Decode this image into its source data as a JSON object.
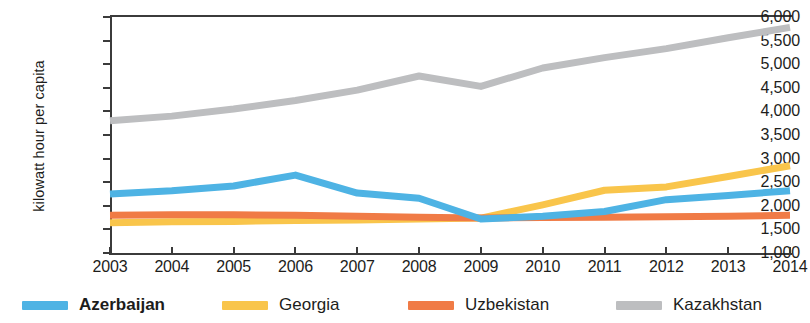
{
  "chart_data": {
    "type": "line",
    "title": "",
    "xlabel": "",
    "ylabel": "kilowatt hour per capita",
    "x": [
      2003,
      2004,
      2005,
      2006,
      2007,
      2008,
      2009,
      2010,
      2011,
      2012,
      2013,
      2014
    ],
    "xtick_labels": [
      "2003",
      "2004",
      "2005",
      "2006",
      "2007",
      "2008",
      "2009",
      "2010",
      "2011",
      "2012",
      "2013",
      "2014"
    ],
    "ytick_labels": [
      "6,000",
      "5,500",
      "5,000",
      "4,500",
      "4,000",
      "3,500",
      "3,000",
      "2,500",
      "2,000",
      "1,500",
      "1,000"
    ],
    "ytick_values": [
      6000,
      5500,
      5000,
      4500,
      4000,
      3500,
      3000,
      2500,
      2000,
      1500,
      1000
    ],
    "ylim": [
      1000,
      6000
    ],
    "ytick_step": 500,
    "grid": false,
    "legend_position": "bottom",
    "series": [
      {
        "name": "Azerbaijan",
        "color": "#4EB3E4",
        "bold_label": true,
        "values": [
          2250,
          2320,
          2420,
          2650,
          2270,
          2160,
          1720,
          1780,
          1880,
          2130,
          2220,
          2320
        ]
      },
      {
        "name": "Georgia",
        "color": "#F9C54B",
        "bold_label": false,
        "values": [
          1640,
          1660,
          1670,
          1690,
          1700,
          1720,
          1740,
          2020,
          2330,
          2400,
          2620,
          2850
        ]
      },
      {
        "name": "Uzbekistan",
        "color": "#F07B46",
        "bold_label": false,
        "values": [
          1800,
          1810,
          1810,
          1800,
          1780,
          1760,
          1740,
          1750,
          1760,
          1770,
          1780,
          1800
        ]
      },
      {
        "name": "Kazakhstan",
        "color": "#BDBEC0",
        "bold_label": false,
        "values": [
          3800,
          3900,
          4050,
          4230,
          4450,
          4750,
          4530,
          4920,
          5140,
          5330,
          5560,
          5780
        ]
      }
    ]
  }
}
